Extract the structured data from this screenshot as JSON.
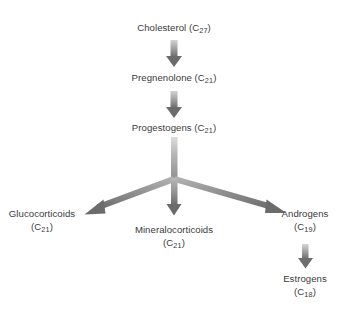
{
  "diagram": {
    "background_color": "#ffffff",
    "text_color": "#3b3b3b",
    "arrow_color_light": "#c9c9c9",
    "arrow_color_dark": "#6b6b6b",
    "nodes": {
      "cholesterol": {
        "name": "Cholesterol",
        "formula_prefix": "(C",
        "formula_sub": "27",
        "formula_suffix": ")",
        "line1": "Cholesterol (C",
        "sub1": "27",
        "tail1": ")"
      },
      "pregnenolone": {
        "name": "Pregnenolone",
        "line1": "Pregnenolone (C",
        "sub1": "21",
        "tail1": ")"
      },
      "progestogens": {
        "name": "Progestogens",
        "line1": "Progestogens (C",
        "sub1": "21",
        "tail1": ")"
      },
      "glucocorticoids": {
        "name": "Glucocorticoids",
        "line1": "Glucocorticoids",
        "line2_prefix": "(C",
        "sub2": "21",
        "line2_suffix": ")"
      },
      "mineralocorticoids": {
        "name": "Mineralocorticoids",
        "line1": "Mineralocorticoids",
        "line2_prefix": "(C",
        "sub2": "21",
        "line2_suffix": ")"
      },
      "androgens": {
        "name": "Androgens",
        "line1": "Androgens",
        "line2_prefix": "(C",
        "sub2": "19",
        "line2_suffix": ")"
      },
      "estrogens": {
        "name": "Estrogens",
        "line1": "Estrogens",
        "line2_prefix": "(C",
        "sub2": "18",
        "line2_suffix": ")"
      }
    },
    "arrows": [
      {
        "id": "cholesterol-to-pregnenolone",
        "orientation": "vertical-down"
      },
      {
        "id": "pregnenolone-to-progestogens",
        "orientation": "vertical-down"
      },
      {
        "id": "progestogens-branch-stem",
        "orientation": "vertical-down"
      },
      {
        "id": "branch-to-glucocorticoids",
        "orientation": "diagonal-down-left"
      },
      {
        "id": "branch-to-mineralocorticoids",
        "orientation": "vertical-down"
      },
      {
        "id": "branch-to-androgens",
        "orientation": "diagonal-down-right"
      },
      {
        "id": "androgens-to-estrogens",
        "orientation": "vertical-down"
      }
    ]
  }
}
